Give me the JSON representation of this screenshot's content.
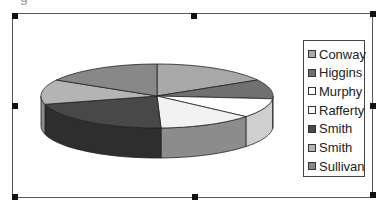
{
  "clipped_text": "g",
  "chart_data": {
    "type": "pie",
    "style": "3d-pie",
    "title": "",
    "categories": [
      "Conway",
      "Higgins",
      "Murphy",
      "Rafferty",
      "Smith",
      "Smith",
      "Sullivan"
    ],
    "values": [
      16.7,
      9.7,
      9.7,
      13.3,
      21.4,
      12.5,
      16.7
    ],
    "angles_deg": [
      [
        0,
        60
      ],
      [
        60,
        95
      ],
      [
        95,
        130
      ],
      [
        130,
        178
      ],
      [
        178,
        255
      ],
      [
        255,
        300
      ],
      [
        300,
        360
      ]
    ],
    "colors": [
      "#a8a8a8",
      "#707070",
      "#ffffff",
      "#f2f2f2",
      "#484848",
      "#b4b4b4",
      "#888888"
    ],
    "side_colors": [
      "#808080",
      "#505050",
      "#cfcfcf",
      "#8c8c8c",
      "#2e2e2e",
      "#8c8c8c",
      "#666666"
    ],
    "legend_position": "right"
  },
  "legend": {
    "items": [
      {
        "label": "Conway",
        "color": "#a8a8a8"
      },
      {
        "label": "Higgins",
        "color": "#707070"
      },
      {
        "label": "Murphy",
        "color": "#ffffff"
      },
      {
        "label": "Rafferty",
        "color": "#f8f8f8"
      },
      {
        "label": "Smith",
        "color": "#484848"
      },
      {
        "label": "Smith",
        "color": "#b4b4b4"
      },
      {
        "label": "Sullivan",
        "color": "#888888"
      }
    ]
  }
}
